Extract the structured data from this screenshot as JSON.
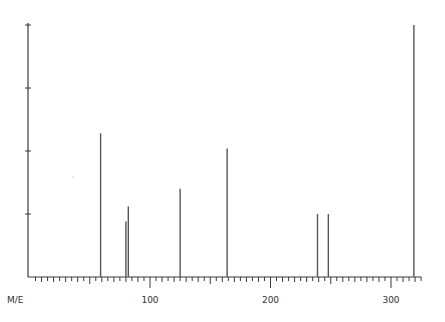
{
  "chart_data": {
    "type": "bar",
    "subtype": "mass-spectrum-stick",
    "title": "",
    "xlabel": "M/E",
    "ylabel": "",
    "xlim": [
      0,
      325
    ],
    "ylim": [
      0,
      100
    ],
    "x_major_ticks": [
      100,
      200,
      300
    ],
    "x_tick_labels": [
      "100",
      "200",
      "300"
    ],
    "y_ticks": [
      0,
      25,
      50,
      75,
      100
    ],
    "y_tick_labels": [],
    "grid": false,
    "legend": null,
    "peaks": [
      {
        "mz": 59,
        "intensity": 57
      },
      {
        "mz": 80,
        "intensity": 22
      },
      {
        "mz": 82,
        "intensity": 28
      },
      {
        "mz": 125,
        "intensity": 35
      },
      {
        "mz": 164,
        "intensity": 51
      },
      {
        "mz": 239,
        "intensity": 25
      },
      {
        "mz": 248,
        "intensity": 25
      },
      {
        "mz": 319,
        "intensity": 100
      }
    ]
  },
  "layout": {
    "x0": 29.5,
    "px_per_unit": 1.205,
    "baseline_y": 277,
    "top_y": 25,
    "axis_end_x": 421
  },
  "labels": {
    "x_axis_title": "M/E"
  }
}
